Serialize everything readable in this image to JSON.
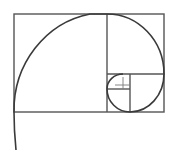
{
  "diagram": {
    "title": "Golden spiral in Fibonacci rectangle",
    "colors": {
      "background": "#ffffff",
      "lines": "#555555",
      "spiral": "#3a3a3a"
    },
    "outer_rect": {
      "x": 14,
      "y": 14,
      "w": 150,
      "h": 98
    },
    "dividers": [
      {
        "x1": 107,
        "y1": 14,
        "x2": 107,
        "y2": 112
      },
      {
        "x1": 107,
        "y1": 74,
        "x2": 164,
        "y2": 74
      },
      {
        "x1": 130,
        "y1": 74,
        "x2": 130,
        "y2": 112
      },
      {
        "x1": 107,
        "y1": 89,
        "x2": 130,
        "y2": 89
      }
    ],
    "cross": {
      "cx": 123,
      "cy": 85
    }
  }
}
